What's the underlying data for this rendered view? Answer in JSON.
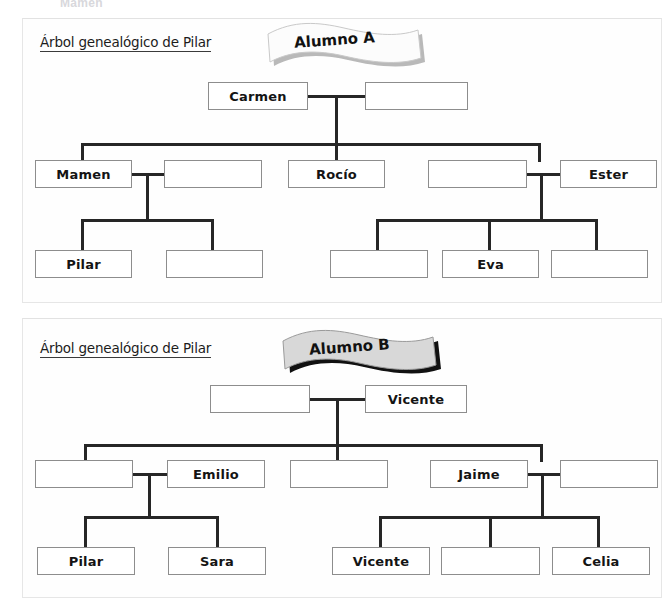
{
  "document": {
    "scan_top_partial_text": "Mamen",
    "background": "#ffffff",
    "line_color": "#262626",
    "box_border_color": "#8d8d8d"
  },
  "trees": [
    {
      "id": "tree-a",
      "title": "Árbol genealógico de Pilar",
      "banner": {
        "label": "Alumno A",
        "fill": "#fcfcfc",
        "shadow": "#b3b3b3"
      },
      "generations": [
        {
          "name": "generation-1",
          "nodes": [
            {
              "label": "Carmen",
              "empty": false
            },
            {
              "label": "",
              "empty": true
            }
          ]
        },
        {
          "name": "generation-2",
          "nodes": [
            {
              "label": "Mamen",
              "empty": false
            },
            {
              "label": "",
              "empty": true
            },
            {
              "label": "Rocío",
              "empty": false
            },
            {
              "label": "",
              "empty": true
            },
            {
              "label": "Ester",
              "empty": false
            }
          ]
        },
        {
          "name": "generation-3",
          "nodes": [
            {
              "label": "Pilar",
              "empty": false
            },
            {
              "label": "",
              "empty": true
            },
            {
              "label": "",
              "empty": true
            },
            {
              "label": "Eva",
              "empty": false
            },
            {
              "label": "",
              "empty": true
            }
          ]
        }
      ]
    },
    {
      "id": "tree-b",
      "title": "Árbol genealógico de Pilar",
      "banner": {
        "label": "Alumno B",
        "fill": "#d8d8d8",
        "shadow": "#111111"
      },
      "generations": [
        {
          "name": "generation-1",
          "nodes": [
            {
              "label": "",
              "empty": true
            },
            {
              "label": "Vicente",
              "empty": false
            }
          ]
        },
        {
          "name": "generation-2",
          "nodes": [
            {
              "label": "",
              "empty": true
            },
            {
              "label": "Emilio",
              "empty": false
            },
            {
              "label": "",
              "empty": true
            },
            {
              "label": "Jaime",
              "empty": false
            },
            {
              "label": "",
              "empty": true
            }
          ]
        },
        {
          "name": "generation-3",
          "nodes": [
            {
              "label": "Pilar",
              "empty": false
            },
            {
              "label": "Sara",
              "empty": false
            },
            {
              "label": "Vicente",
              "empty": false
            },
            {
              "label": "",
              "empty": true
            },
            {
              "label": "Celia",
              "empty": false
            }
          ]
        }
      ]
    }
  ]
}
